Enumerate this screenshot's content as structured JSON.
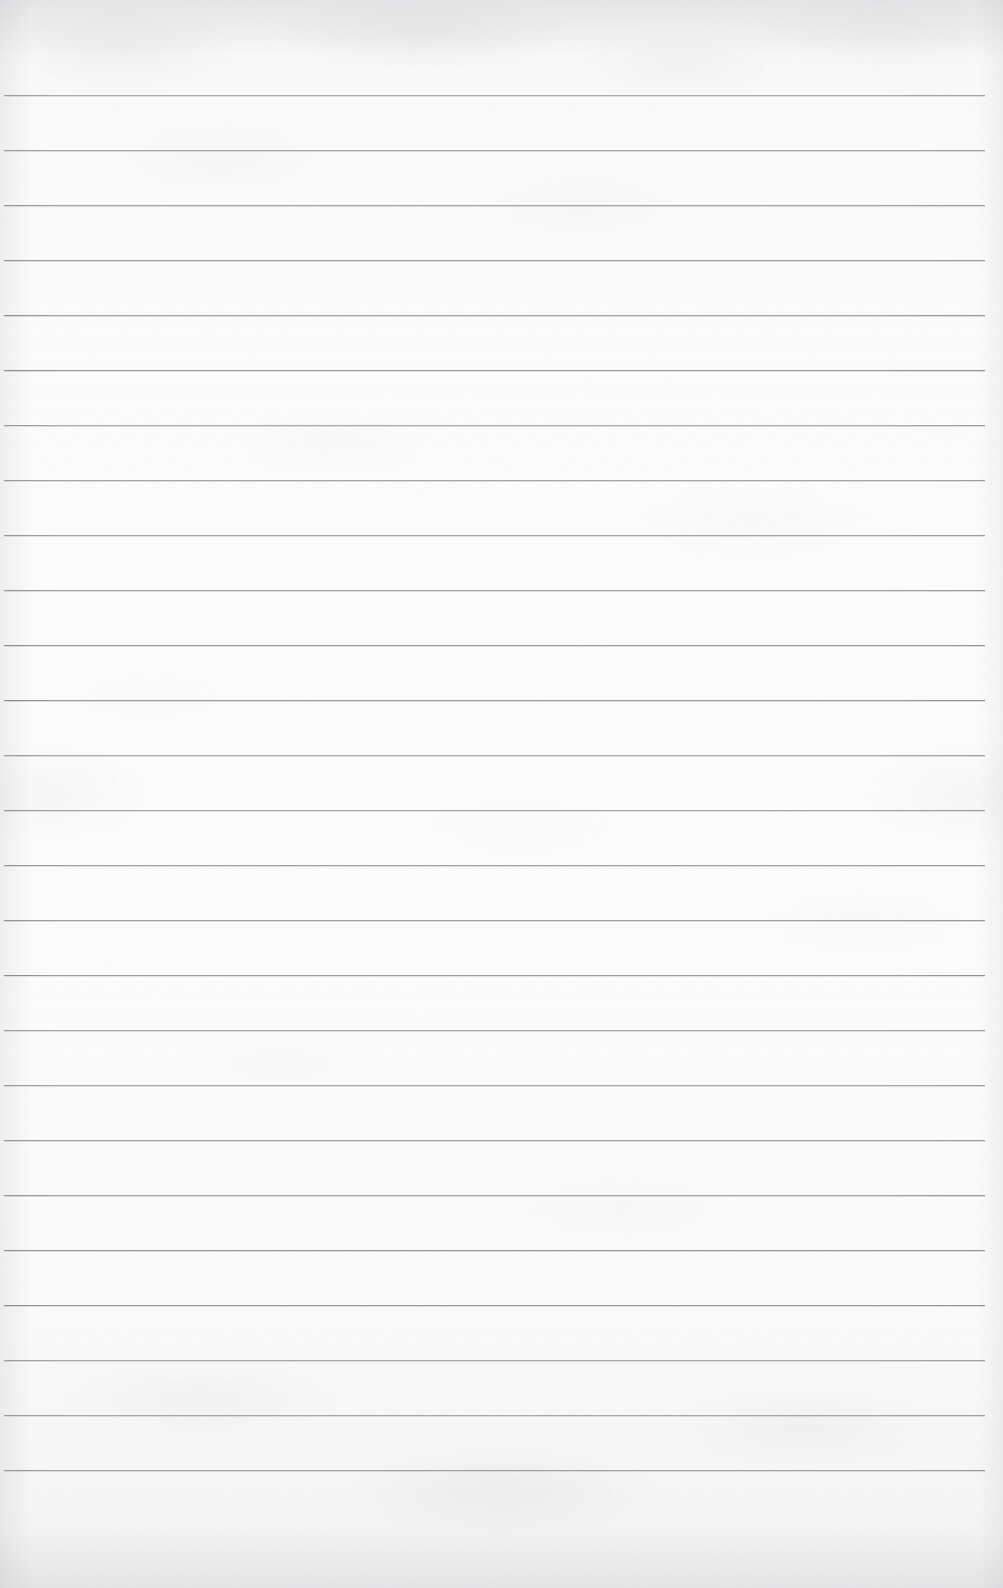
{
  "document": {
    "type": "lined-paper-scan",
    "title": "Blank ruled notebook page",
    "description": "Scanned sheet of blank wide-ruled lined paper with no handwriting or printed text",
    "width_px": 1003,
    "height_px": 1588,
    "has_text_content": false,
    "has_handwriting": false,
    "has_margin_rule": false,
    "has_binder_holes": false
  },
  "paper": {
    "background_color": "#fbfbfb",
    "top_edge_color": "#f4f4f5",
    "bottom_edge_color": "#f2f2f3",
    "texture": "mottled scan grain"
  },
  "rules": {
    "line_color": "#96979d",
    "line_thickness_px": 1,
    "line_spacing_px": 55,
    "first_line_y_px": 95,
    "last_line_y_px": 1470,
    "line_start_x_px": 4,
    "line_end_x_px": 985,
    "line_count": 26,
    "positions_y": [
      95,
      150,
      205,
      260,
      315,
      370,
      425,
      480,
      535,
      590,
      645,
      700,
      755,
      810,
      865,
      920,
      975,
      1030,
      1085,
      1140,
      1195,
      1250,
      1305,
      1360,
      1415,
      1470
    ]
  },
  "margins": {
    "top_px": 95,
    "bottom_px": 118,
    "left_px": 4,
    "right_px": 18
  }
}
